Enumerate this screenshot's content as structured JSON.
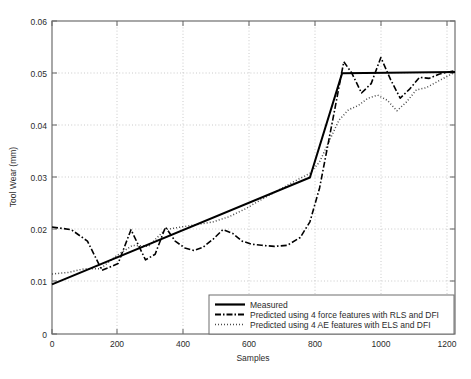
{
  "chart_data": {
    "type": "line",
    "title": "",
    "xlabel": "Samples",
    "ylabel": "Tool Wear (mm)",
    "xlim": [
      0,
      1250
    ],
    "ylim": [
      0,
      0.06
    ],
    "xticks": [
      0,
      200,
      400,
      600,
      800,
      1000,
      1200
    ],
    "xtick_labels": [
      "0",
      "200",
      "400",
      "600",
      "800",
      "1000",
      "1200"
    ],
    "yticks": [
      0,
      0.01,
      0.02,
      0.03,
      0.04,
      0.05,
      0.06
    ],
    "ytick_labels": [
      "0",
      "0.01",
      "0.02",
      "0.03",
      "0.04",
      "0.05",
      "0.06"
    ],
    "grid": "dotted-both-axes",
    "legend_position": "lower-right-inside",
    "series": [
      {
        "name": "Measured",
        "style": "solid",
        "color": "#000000",
        "width": 2.0,
        "x": [
          0,
          800,
          900,
          1250
        ],
        "y": [
          0.0095,
          0.03,
          0.05,
          0.0502
        ]
      },
      {
        "name": "Predicted using 4 force features with RLS and DFI",
        "style": "dashdot",
        "color": "#000000",
        "width": 1.6,
        "x": [
          0,
          60,
          110,
          155,
          205,
          245,
          262,
          290,
          320,
          352,
          382,
          412,
          440,
          468,
          500,
          530,
          560,
          590,
          620,
          650,
          690,
          730,
          770,
          800,
          830,
          855,
          880,
          905,
          930,
          960,
          990,
          1020,
          1050,
          1080,
          1110,
          1140,
          1170,
          1200,
          1250
        ],
        "y": [
          0.0205,
          0.02,
          0.0178,
          0.0122,
          0.0135,
          0.02,
          0.0178,
          0.0142,
          0.0153,
          0.0205,
          0.0178,
          0.0165,
          0.016,
          0.0166,
          0.0182,
          0.02,
          0.0193,
          0.0178,
          0.0172,
          0.017,
          0.0168,
          0.017,
          0.0185,
          0.0215,
          0.028,
          0.036,
          0.044,
          0.0522,
          0.05,
          0.0462,
          0.048,
          0.053,
          0.0488,
          0.0452,
          0.047,
          0.0492,
          0.049,
          0.0498,
          0.0505
        ]
      },
      {
        "name": "Predicted using 4 AE features with ELS and DFI",
        "style": "dotted",
        "color": "#4a4a4a",
        "width": 1.5,
        "x": [
          0,
          50,
          100,
          150,
          200,
          250,
          300,
          350,
          400,
          450,
          500,
          550,
          600,
          650,
          700,
          750,
          800,
          830,
          860,
          890,
          920,
          950,
          980,
          1010,
          1040,
          1070,
          1100,
          1130,
          1160,
          1190,
          1220,
          1250
        ],
        "y": [
          0.0115,
          0.0118,
          0.0125,
          0.0125,
          0.015,
          0.017,
          0.0168,
          0.02,
          0.0205,
          0.021,
          0.0215,
          0.0225,
          0.024,
          0.0258,
          0.0275,
          0.0292,
          0.0308,
          0.033,
          0.037,
          0.041,
          0.043,
          0.0438,
          0.0452,
          0.0458,
          0.0448,
          0.0428,
          0.0445,
          0.0468,
          0.0472,
          0.0482,
          0.0492,
          0.0502
        ]
      }
    ]
  },
  "legend": {
    "items": [
      {
        "label": "Measured",
        "style": "solid"
      },
      {
        "label": "Predicted using 4 force features with RLS and DFI",
        "style": "dashdot"
      },
      {
        "label": "Predicted using 4 AE features with ELS and DFI",
        "style": "dotted"
      }
    ]
  },
  "colors": {
    "axis": "#6e6e6e",
    "grid": "#bdbdbd",
    "text": "#2b2b2b",
    "measured": "#000000",
    "force_pred": "#000000",
    "ae_pred": "#4a4a4a",
    "background": "#ffffff"
  }
}
